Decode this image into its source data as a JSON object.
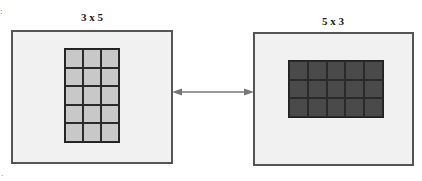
{
  "diagram": {
    "left": {
      "label": "3 x 5",
      "columns": 3,
      "rows": 5,
      "cell_color": "#c8c8c8"
    },
    "right": {
      "label": "5 x 3",
      "columns": 5,
      "rows": 3,
      "cell_color": "#4a4a4a"
    },
    "connector": {
      "type": "double-headed-arrow",
      "color": "#777777"
    },
    "colors": {
      "box_fill": "#f1f1f1",
      "box_border": "#555555"
    }
  }
}
